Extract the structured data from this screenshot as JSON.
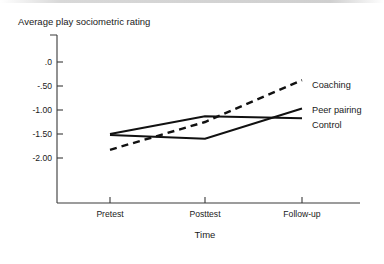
{
  "chart_data": {
    "type": "line",
    "title": "Average play sociometric rating",
    "xlabel": "Time",
    "ylabel": "Average play sociometric rating",
    "categories": [
      "Pretest",
      "Posttest",
      "Follow-up"
    ],
    "ytick_labels": [
      ".0",
      "-.50",
      "-1.00",
      "-1.50",
      "-2.00"
    ],
    "ytick_values": [
      0,
      -0.5,
      -1.0,
      -1.5,
      -2.0
    ],
    "ylim": [
      -2.25,
      0.1
    ],
    "grid": false,
    "legend_position": "right-inline",
    "series": [
      {
        "name": "Coaching",
        "style": "dashed",
        "color": "#111111",
        "values": [
          -1.83,
          -1.25,
          -0.38
        ]
      },
      {
        "name": "Peer pairing",
        "style": "solid",
        "color": "#111111",
        "values": [
          -1.52,
          -1.6,
          -0.97
        ]
      },
      {
        "name": "Control",
        "style": "solid",
        "color": "#111111",
        "values": [
          -1.5,
          -1.13,
          -1.17
        ]
      }
    ]
  },
  "labels": {
    "y_axis_title": "Average play sociometric rating",
    "x_axis_title": "Time",
    "ytick_0": ".0",
    "ytick_1": "-.50",
    "ytick_2": "-1.00",
    "ytick_3": "-1.50",
    "ytick_4": "-2.00",
    "xtick_0": "Pretest",
    "xtick_1": "Posttest",
    "xtick_2": "Follow-up",
    "series_0": "Coaching",
    "series_1": "Peer pairing",
    "series_2": "Control"
  }
}
